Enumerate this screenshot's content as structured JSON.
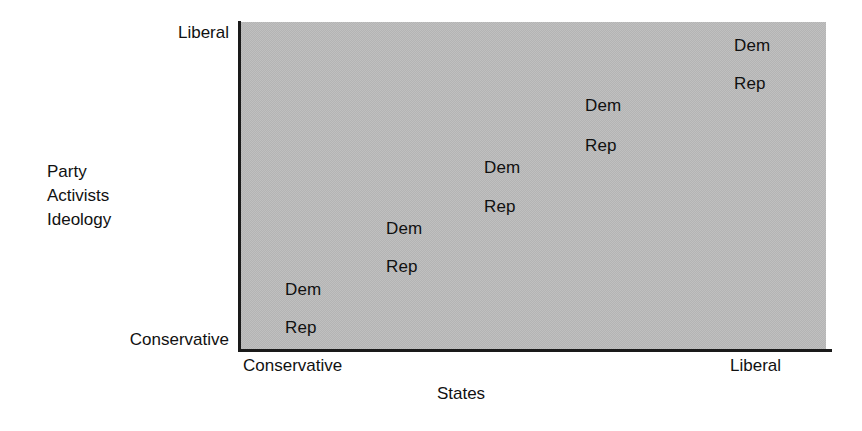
{
  "chart_data": {
    "type": "scatter",
    "title": "",
    "subtitle": "",
    "xlabel": "States",
    "ylabel": "Party Activists Ideology",
    "ylabel_lines": [
      "Party",
      "Activists",
      "Ideology"
    ],
    "x_tick_labels": [
      "Conservative",
      "Liberal"
    ],
    "y_tick_labels": [
      "Conservative",
      "Liberal"
    ],
    "xlim_labels": [
      "Conservative",
      "Liberal"
    ],
    "ylim_labels": [
      "Conservative",
      "Liberal"
    ],
    "grid": false,
    "legend": "none",
    "panel_color": "#b4b4b4",
    "axis_color": "#1a1a1a",
    "text_color": "#111111",
    "series": [
      {
        "name": "Dem",
        "label": "Dem",
        "points": [
          {
            "label": "Dem",
            "x": 0.08,
            "y": 0.2,
            "px": 285,
            "py": 281
          },
          {
            "label": "Dem",
            "x": 0.26,
            "y": 0.39,
            "px": 386,
            "py": 220
          },
          {
            "label": "Dem",
            "x": 0.43,
            "y": 0.57,
            "px": 484,
            "py": 159
          },
          {
            "label": "Dem",
            "x": 0.61,
            "y": 0.75,
            "px": 585,
            "py": 97
          },
          {
            "label": "Dem",
            "x": 0.78,
            "y": 0.94,
            "px": 734,
            "py": 37
          }
        ]
      },
      {
        "name": "Rep",
        "label": "Rep",
        "points": [
          {
            "label": "Rep",
            "x": 0.08,
            "y": 0.06,
            "px": 285,
            "py": 319
          },
          {
            "label": "Rep",
            "x": 0.26,
            "y": 0.25,
            "px": 386,
            "py": 258
          },
          {
            "label": "Rep",
            "x": 0.43,
            "y": 0.43,
            "px": 484,
            "py": 198
          },
          {
            "label": "Rep",
            "x": 0.61,
            "y": 0.62,
            "px": 585,
            "py": 137
          },
          {
            "label": "Rep",
            "x": 0.78,
            "y": 0.8,
            "px": 734,
            "py": 75
          }
        ]
      }
    ],
    "annotations": []
  },
  "axes": {
    "y": {
      "title_lines": [
        "Party",
        "Activists",
        "Ideology"
      ],
      "tick_top": "Liberal",
      "tick_bottom": "Conservative"
    },
    "x": {
      "title": "States",
      "tick_left": "Conservative",
      "tick_right": "Liberal"
    }
  }
}
